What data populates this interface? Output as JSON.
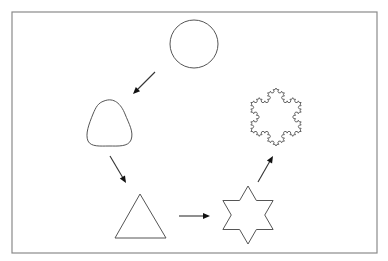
{
  "diagram": {
    "title": "Shape transformation sequence: circle to Koch snowflake",
    "frame": {
      "x": 12,
      "y": 12,
      "width": 365,
      "height": 241,
      "color": "#8a8a8a"
    },
    "stroke_color": "#555555",
    "arrow_color": "#111111",
    "nodes": [
      {
        "id": "circle",
        "label": "Circle",
        "shape": "circle",
        "cx": 194,
        "cy": 44,
        "r": 24
      },
      {
        "id": "rounded-triangle",
        "label": "Rounded triangle",
        "shape": "rounded-triangle",
        "cx": 109,
        "cy": 124
      },
      {
        "id": "triangle",
        "label": "Triangle",
        "shape": "triangle",
        "points": [
          [
            140,
            194
          ],
          [
            166,
            238
          ],
          [
            115,
            238
          ]
        ]
      },
      {
        "id": "hexagram",
        "label": "Star of David (hexagram)",
        "shape": "hexagram",
        "cx": 248,
        "cy": 215,
        "outer_r": 29
      },
      {
        "id": "koch-snowflake",
        "label": "Koch snowflake",
        "shape": "koch-snowflake",
        "cx": 276,
        "cy": 117,
        "radius": 29,
        "iterations": 3
      }
    ],
    "edges": [
      {
        "from": "circle",
        "to": "rounded-triangle",
        "x1": 155,
        "y1": 72,
        "x2": 133,
        "y2": 94
      },
      {
        "from": "rounded-triangle",
        "to": "triangle",
        "x1": 110,
        "y1": 156,
        "x2": 126,
        "y2": 183
      },
      {
        "from": "triangle",
        "to": "hexagram",
        "x1": 179,
        "y1": 216,
        "x2": 210,
        "y2": 216
      },
      {
        "from": "hexagram",
        "to": "koch-snowflake",
        "x1": 258,
        "y1": 182,
        "x2": 273,
        "y2": 156
      }
    ]
  }
}
